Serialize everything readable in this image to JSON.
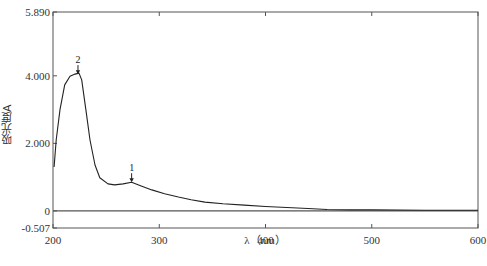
{
  "chart_data": {
    "type": "line",
    "title": "",
    "xlabel": "λ（nm）",
    "ylabel": "吸光度A",
    "xlim": [
      200,
      600
    ],
    "ylim": [
      -0.507,
      5.89
    ],
    "x_ticks": [
      200,
      300,
      400,
      500,
      600
    ],
    "x_tick_labels": [
      "200",
      "300",
      "400",
      "500",
      "600"
    ],
    "y_ticks": [
      -0.507,
      0,
      2.0,
      4.0,
      5.89
    ],
    "y_tick_labels": [
      "-0.507",
      "0",
      "2.000",
      "4.000",
      "5.890"
    ],
    "grid": false,
    "legend": null,
    "baseline": 0,
    "series": [
      {
        "name": "absorbance",
        "x": [
          201,
          203,
          206.6,
          211,
          216,
          220.7,
          224.5,
          227,
          231,
          234.8,
          239.5,
          244,
          251.8,
          258,
          266,
          274,
          283,
          293,
          305,
          318,
          330,
          343,
          360,
          380,
          400,
          420,
          440,
          458,
          480,
          500,
          550,
          600
        ],
        "y": [
          1.3,
          2.1,
          3.0,
          3.73,
          3.99,
          4.05,
          4.08,
          3.88,
          2.99,
          2.1,
          1.36,
          0.98,
          0.8,
          0.77,
          0.8,
          0.85,
          0.74,
          0.62,
          0.51,
          0.41,
          0.33,
          0.26,
          0.21,
          0.17,
          0.13,
          0.1,
          0.07,
          0.04,
          0.03,
          0.03,
          0.02,
          0.02
        ]
      }
    ],
    "annotations": [
      {
        "label": "2",
        "x": 223.5,
        "y": 4.05,
        "marker": "arrow-down"
      },
      {
        "label": "1",
        "x": 274,
        "y": 0.85,
        "marker": "arrow-down"
      }
    ]
  },
  "layout": {
    "plot": {
      "left": 53,
      "top": 12,
      "right": 478,
      "bottom": 228
    },
    "colors": {
      "axis": "#555555",
      "curve": "#222222",
      "zero_line": "#555555"
    }
  }
}
